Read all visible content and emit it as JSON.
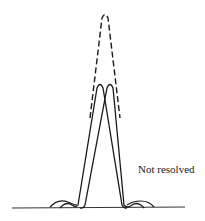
{
  "diagram": {
    "title": "",
    "annotation": "Not resolved",
    "elements": {
      "combined_envelope": {
        "style": "dashed",
        "peak": [
          105,
          14
        ]
      },
      "left_peak": {
        "style": "solid",
        "peak": [
          100,
          84
        ]
      },
      "right_peak": {
        "style": "solid",
        "peak": [
          110,
          84
        ]
      },
      "baseline": {
        "y": 208,
        "x_start": 12,
        "x_end": 185
      }
    },
    "colors": {
      "line": "#1a1a1a",
      "background": "#ffffff"
    }
  }
}
